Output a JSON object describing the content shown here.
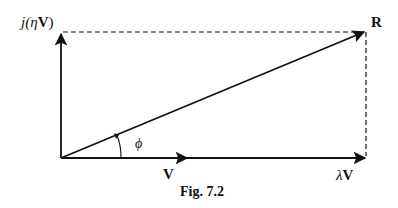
{
  "figure": {
    "caption": "Fig. 7.2",
    "colors": {
      "ink": "#111111",
      "background": "#ffffff"
    },
    "labels": {
      "vertical_vector_prefix": "j(",
      "vertical_vector_eta": "η",
      "vertical_vector_V": "V",
      "vertical_vector_suffix": ")",
      "resultant": "R",
      "angle": "ϕ",
      "base_vector": "V",
      "scaled_vector_lambda": "λ",
      "scaled_vector_V": "V"
    },
    "vectors": [
      {
        "name": "V",
        "from": [
          61,
          158
        ],
        "to": [
          188,
          158
        ],
        "style": "solid"
      },
      {
        "name": "λV",
        "from": [
          61,
          158
        ],
        "to": [
          366,
          158
        ],
        "style": "solid"
      },
      {
        "name": "j(ηV)",
        "from": [
          61,
          158
        ],
        "to": [
          61,
          33
        ],
        "style": "solid"
      },
      {
        "name": "R",
        "from": [
          61,
          158
        ],
        "to": [
          366,
          31
        ],
        "style": "solid"
      }
    ],
    "dashed_lines": [
      {
        "from": [
          61,
          32
        ],
        "to": [
          366,
          32
        ]
      },
      {
        "from": [
          366,
          32
        ],
        "to": [
          366,
          158
        ]
      }
    ]
  }
}
